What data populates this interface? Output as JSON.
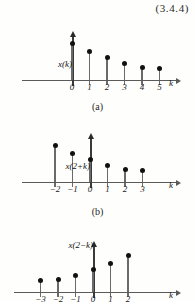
{
  "figure": {
    "equation_number": "(3.4.4)",
    "background_color": "#ffffff",
    "stem_color": "#111111",
    "axis_color": "#5a5a5a"
  },
  "chart_data": [
    {
      "type": "stem",
      "id": "plot-a",
      "caption": "(a)",
      "ylabel": "x(k)",
      "xlabel": "k",
      "x": [
        0,
        1,
        2,
        3,
        4,
        5
      ],
      "values": [
        1.0,
        0.78,
        0.6,
        0.45,
        0.33,
        0.3
      ],
      "tick_labels": [
        "0",
        "1",
        "2",
        "3",
        "4",
        "5"
      ],
      "xlim": [
        -1,
        7
      ],
      "ylim": [
        0,
        1.15
      ],
      "grid": false,
      "legend": "none"
    },
    {
      "type": "stem",
      "id": "plot-b",
      "caption": "(b)",
      "ylabel": "x(2+k)",
      "xlabel": "k",
      "x": [
        -2,
        -1,
        0,
        1,
        2,
        3
      ],
      "values": [
        1.0,
        0.78,
        0.6,
        0.45,
        0.33,
        0.3
      ],
      "tick_labels": [
        "−2",
        "−1",
        "0",
        "1",
        "2",
        "3"
      ],
      "xlim": [
        -3,
        7
      ],
      "ylim": [
        0,
        1.15
      ],
      "grid": false,
      "legend": "none"
    },
    {
      "type": "stem",
      "id": "plot-c",
      "caption": "",
      "ylabel": "x(2−k)",
      "xlabel": "k",
      "x": [
        -3,
        -2,
        -1,
        0,
        1,
        2
      ],
      "values": [
        0.3,
        0.33,
        0.45,
        0.6,
        0.78,
        1.0
      ],
      "tick_labels": [
        "−3",
        "−2",
        "−1",
        "0",
        "1",
        "2"
      ],
      "xlim": [
        -4,
        7
      ],
      "ylim": [
        0,
        1.15
      ],
      "grid": false,
      "legend": "none",
      "clipped": "bottom"
    }
  ]
}
